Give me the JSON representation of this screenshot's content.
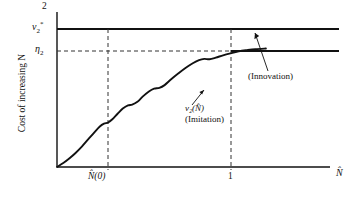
{
  "chart_data": {
    "type": "line",
    "title": "",
    "xlabel": "N̂",
    "ylabel": "Cost of increasing N",
    "xlim": [
      0,
      1.35
    ],
    "ylim": [
      0,
      2
    ],
    "grid": false,
    "legend": "inline-annotations",
    "x_ticks": [
      {
        "value": 0.19,
        "label": "N̂(0)"
      },
      {
        "value": 1.0,
        "label": "1"
      }
    ],
    "y_ticks": [
      {
        "value": 2.0,
        "label": "2"
      },
      {
        "value": 1.74,
        "label": "ν₂*"
      },
      {
        "value": 1.49,
        "label": "η₂"
      }
    ],
    "series": [
      {
        "name": "ν₂(N̂)",
        "role": "imitation",
        "style": "solid-wavy",
        "description": "Wavy increasing imitation cost curve rising from the origin to η₂ at N̂ = 1, then flat at η₂.",
        "points": [
          [
            0.0,
            0.0
          ],
          [
            0.03,
            0.05
          ],
          [
            0.06,
            0.11
          ],
          [
            0.09,
            0.18
          ],
          [
            0.12,
            0.26
          ],
          [
            0.15,
            0.35
          ],
          [
            0.18,
            0.44
          ],
          [
            0.205,
            0.51
          ],
          [
            0.225,
            0.545
          ],
          [
            0.245,
            0.56
          ],
          [
            0.265,
            0.6
          ],
          [
            0.29,
            0.67
          ],
          [
            0.315,
            0.735
          ],
          [
            0.34,
            0.775
          ],
          [
            0.36,
            0.785
          ],
          [
            0.385,
            0.82
          ],
          [
            0.41,
            0.885
          ],
          [
            0.44,
            0.95
          ],
          [
            0.465,
            0.985
          ],
          [
            0.49,
            0.995
          ],
          [
            0.515,
            1.03
          ],
          [
            0.545,
            1.1
          ],
          [
            0.58,
            1.175
          ],
          [
            0.615,
            1.245
          ],
          [
            0.65,
            1.305
          ],
          [
            0.68,
            1.345
          ],
          [
            0.705,
            1.36
          ],
          [
            0.73,
            1.355
          ],
          [
            0.76,
            1.375
          ],
          [
            0.795,
            1.405
          ],
          [
            0.83,
            1.43
          ],
          [
            0.87,
            1.455
          ],
          [
            0.91,
            1.47
          ],
          [
            0.95,
            1.482
          ],
          [
            1.0,
            1.49
          ],
          [
            1.12,
            1.49
          ],
          [
            1.25,
            1.49
          ],
          [
            1.35,
            1.49
          ]
        ]
      },
      {
        "name": "ν₂*",
        "role": "innovation",
        "style": "solid-horizontal",
        "description": "Constant innovation cost at ν₂*.",
        "value": 1.74
      }
    ],
    "reference_lines": [
      {
        "name": "eta2-horizontal",
        "orientation": "horizontal",
        "value": 1.49,
        "style": "dashed"
      },
      {
        "name": "nhat0-vertical",
        "orientation": "vertical",
        "value": 0.19,
        "style": "dashed"
      },
      {
        "name": "one-vertical",
        "orientation": "vertical",
        "value": 1.0,
        "style": "dashed"
      }
    ],
    "annotations": [
      {
        "name": "imitation-label",
        "line1": "ν₂(N̂)",
        "line2": "(Imitation)",
        "points_to": "imitation-curve"
      },
      {
        "name": "innovation-label",
        "text": "(Innovation)",
        "points_to": "innovation-line"
      }
    ]
  },
  "axes": {
    "y_label": "Cost of increasing N",
    "x_label": "N̂",
    "y_tick_top": "2",
    "y_tick_nu2star": "ν₂*",
    "y_tick_eta2": "η₂",
    "x_tick_nhat0": "N̂(0)",
    "x_tick_one": "1"
  },
  "labels": {
    "imitation_curve_name": "ν₂(N̂)",
    "imitation_caption": "(Imitation)",
    "innovation_caption": "(Innovation)"
  },
  "colors": {
    "ink": "#111111",
    "background": "#ffffff",
    "dash": "#333333"
  }
}
